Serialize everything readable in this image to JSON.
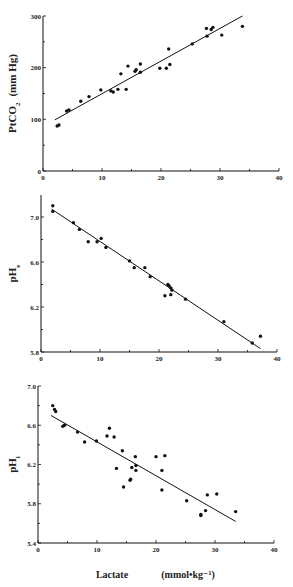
{
  "figure": {
    "xlabel": "Lactate",
    "xunit": "(mmol•kg⁻¹)"
  },
  "chart_data": [
    {
      "type": "scatter",
      "title": "",
      "ylabel_main": "PtCO",
      "ylabel_sub": "2",
      "ylabel_unit": "(mm Hg)",
      "xlabel": "",
      "xlim": [
        0,
        40
      ],
      "ylim": [
        0,
        300
      ],
      "xticks": [
        0,
        10,
        20,
        30,
        40
      ],
      "yticks": [
        0,
        100,
        200,
        300
      ],
      "ytick_labels": [
        "0",
        "100",
        "200",
        "300"
      ],
      "grid": false,
      "points": [
        [
          2.4,
          87
        ],
        [
          2.7,
          89
        ],
        [
          4.0,
          116
        ],
        [
          4.4,
          118
        ],
        [
          6.4,
          135
        ],
        [
          7.8,
          144
        ],
        [
          9.8,
          157
        ],
        [
          11.5,
          155
        ],
        [
          11.9,
          153
        ],
        [
          12.7,
          158
        ],
        [
          13.2,
          188
        ],
        [
          14.1,
          158
        ],
        [
          14.4,
          203
        ],
        [
          15.6,
          193
        ],
        [
          15.8,
          196
        ],
        [
          16.5,
          207
        ],
        [
          16.5,
          191
        ],
        [
          19.8,
          199
        ],
        [
          20.9,
          199
        ],
        [
          21.3,
          236
        ],
        [
          21.5,
          206
        ],
        [
          25.3,
          246
        ],
        [
          27.8,
          261
        ],
        [
          27.7,
          276
        ],
        [
          28.5,
          274
        ],
        [
          28.8,
          278
        ],
        [
          30.3,
          263
        ],
        [
          33.8,
          280
        ]
      ],
      "regression_line": [
        [
          2.0,
          99
        ],
        [
          33.8,
          300
        ]
      ]
    },
    {
      "type": "scatter",
      "title": "",
      "ylabel_main": "pH",
      "ylabel_sub": "e",
      "ylabel_unit": "",
      "xlabel": "",
      "xlim": [
        0,
        40
      ],
      "ylim": [
        5.8,
        7.2
      ],
      "xticks": [
        0,
        10,
        20,
        30,
        40
      ],
      "yticks": [
        5.8,
        6.2,
        6.6,
        7.0
      ],
      "ytick_labels": [
        "5.8",
        "6.2",
        "6.6",
        "7.0"
      ],
      "grid": false,
      "points": [
        [
          2.0,
          7.1
        ],
        [
          2.0,
          7.05
        ],
        [
          5.5,
          6.95
        ],
        [
          6.5,
          6.89
        ],
        [
          8.0,
          6.78
        ],
        [
          9.5,
          6.78
        ],
        [
          10.2,
          6.81
        ],
        [
          11.0,
          6.73
        ],
        [
          15.0,
          6.61
        ],
        [
          15.8,
          6.55
        ],
        [
          17.6,
          6.55
        ],
        [
          18.5,
          6.47
        ],
        [
          21.0,
          6.3
        ],
        [
          21.5,
          6.4
        ],
        [
          21.7,
          6.39
        ],
        [
          22.0,
          6.37
        ],
        [
          22.0,
          6.31
        ],
        [
          22.2,
          6.35
        ],
        [
          24.5,
          6.27
        ],
        [
          31.0,
          6.07
        ],
        [
          35.8,
          5.88
        ],
        [
          37.2,
          5.94
        ]
      ],
      "regression_line": [
        [
          1.8,
          7.07
        ],
        [
          37.2,
          5.83
        ]
      ]
    },
    {
      "type": "scatter",
      "title": "",
      "ylabel_main": "pH",
      "ylabel_sub": "i",
      "ylabel_unit": "",
      "xlabel": "Lactate (mmol•kg⁻¹)",
      "xlim": [
        0,
        40
      ],
      "ylim": [
        5.4,
        7.0
      ],
      "xticks": [
        0,
        10,
        20,
        30,
        40
      ],
      "yticks": [
        5.4,
        5.8,
        6.2,
        6.6,
        7.0
      ],
      "ytick_labels": [
        "5.4",
        "5.8",
        "6.2",
        "6.6",
        "7.0"
      ],
      "grid": false,
      "points": [
        [
          2.5,
          6.8
        ],
        [
          2.8,
          6.76
        ],
        [
          3.0,
          6.74
        ],
        [
          4.2,
          6.59
        ],
        [
          4.5,
          6.6
        ],
        [
          6.7,
          6.53
        ],
        [
          7.9,
          6.43
        ],
        [
          9.9,
          6.44
        ],
        [
          11.7,
          6.49
        ],
        [
          12.1,
          6.57
        ],
        [
          12.9,
          6.48
        ],
        [
          13.3,
          6.16
        ],
        [
          14.3,
          6.34
        ],
        [
          14.5,
          5.97
        ],
        [
          15.6,
          6.04
        ],
        [
          15.7,
          6.05
        ],
        [
          15.9,
          6.17
        ],
        [
          16.5,
          6.28
        ],
        [
          16.6,
          6.19
        ],
        [
          16.6,
          6.14
        ],
        [
          20.0,
          6.28
        ],
        [
          21.0,
          6.14
        ],
        [
          21.0,
          5.94
        ],
        [
          21.5,
          6.29
        ],
        [
          25.2,
          5.83
        ],
        [
          27.6,
          5.69
        ],
        [
          27.6,
          5.68
        ],
        [
          28.4,
          5.73
        ],
        [
          28.7,
          5.89
        ],
        [
          30.3,
          5.9
        ],
        [
          33.5,
          5.72
        ]
      ],
      "regression_line": [
        [
          2.2,
          6.7
        ],
        [
          33.5,
          5.62
        ]
      ]
    }
  ],
  "layout": {
    "panels": [
      {
        "x0": 43,
        "x40": 279,
        "ytop": 16,
        "ybottom": 171,
        "ytop_val": 300,
        "ybot_val": 0,
        "axis_top": 16
      },
      {
        "x0": 41,
        "x40": 277,
        "ytop": 217,
        "ybottom": 352,
        "ytop_val": 7.0,
        "ybot_val": 5.8,
        "axis_top": 195
      },
      {
        "x0": 38,
        "x40": 274,
        "ytop": 386,
        "ybottom": 543,
        "ytop_val": 7.0,
        "ybot_val": 5.4,
        "axis_top": 386
      }
    ],
    "colors": {
      "ink": "#111111",
      "background": "#ffffff"
    }
  }
}
